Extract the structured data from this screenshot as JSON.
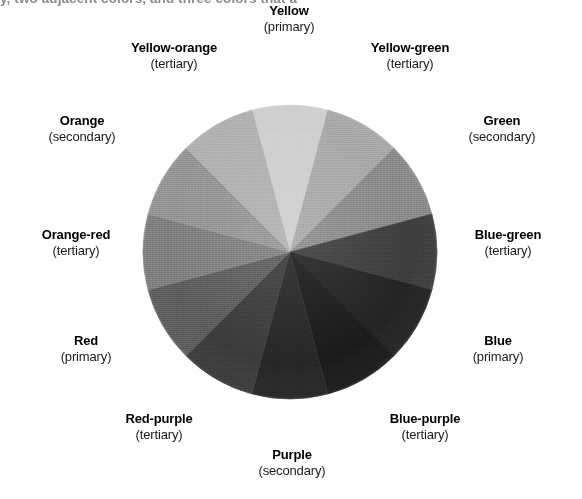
{
  "figure": {
    "caption_clipped": "y, two adjacent colors, and three colors that a"
  },
  "wheel": {
    "center_x": 148,
    "center_y": 148,
    "radius": 147,
    "segment_count": 12,
    "segment_degrees": 30,
    "start_angle_deg": -15,
    "segments": [
      {
        "id": "yellow",
        "name": "Yellow",
        "kind": "(primary)",
        "color": "#cfcfcf",
        "angle_center_deg": 0
      },
      {
        "id": "yellow-green",
        "name": "Yellow-green",
        "kind": "(tertiary)",
        "color": "#a9a9a9",
        "angle_center_deg": 30
      },
      {
        "id": "green",
        "name": "Green",
        "kind": "(secondary)",
        "color": "#8b8b8b",
        "angle_center_deg": 60
      },
      {
        "id": "blue-green",
        "name": "Blue-green",
        "kind": "(tertiary)",
        "color": "#3d3d3d",
        "angle_center_deg": 90
      },
      {
        "id": "blue",
        "name": "Blue",
        "kind": "(primary)",
        "color": "#232323",
        "angle_center_deg": 120
      },
      {
        "id": "blue-purple",
        "name": "Blue-purple",
        "kind": "(tertiary)",
        "color": "#1a1a1a",
        "angle_center_deg": 150
      },
      {
        "id": "purple",
        "name": "Purple",
        "kind": "(secondary)",
        "color": "#262626",
        "angle_center_deg": 180
      },
      {
        "id": "red-purple",
        "name": "Red-purple",
        "kind": "(tertiary)",
        "color": "#3b3b3b",
        "angle_center_deg": 210
      },
      {
        "id": "red",
        "name": "Red",
        "kind": "(primary)",
        "color": "#5d5d5d",
        "angle_center_deg": 240
      },
      {
        "id": "orange-red",
        "name": "Orange-red",
        "kind": "(tertiary)",
        "color": "#7f7f7f",
        "angle_center_deg": 270
      },
      {
        "id": "orange",
        "name": "Orange",
        "kind": "(secondary)",
        "color": "#959595",
        "angle_center_deg": 300
      },
      {
        "id": "yellow-orange",
        "name": "Yellow-orange",
        "kind": "(tertiary)",
        "color": "#b1b1b1",
        "angle_center_deg": 330
      }
    ]
  },
  "chart_data": {
    "type": "pie",
    "categories": [
      "Yellow",
      "Yellow-green",
      "Green",
      "Blue-green",
      "Blue",
      "Blue-purple",
      "Purple",
      "Red-purple",
      "Red",
      "Orange-red",
      "Orange",
      "Yellow-orange"
    ],
    "values": [
      30,
      30,
      30,
      30,
      30,
      30,
      30,
      30,
      30,
      30,
      30,
      30
    ],
    "value_unit": "degrees",
    "colors": [
      "#cfcfcf",
      "#a9a9a9",
      "#8b8b8b",
      "#3d3d3d",
      "#232323",
      "#1a1a1a",
      "#262626",
      "#3b3b3b",
      "#5d5d5d",
      "#7f7f7f",
      "#959595",
      "#b1b1b1"
    ],
    "annotations": [
      "(primary)",
      "(tertiary)",
      "(secondary)",
      "(tertiary)",
      "(primary)",
      "(tertiary)",
      "(secondary)",
      "(tertiary)",
      "(primary)",
      "(tertiary)",
      "(secondary)",
      "(tertiary)"
    ],
    "legend": "none",
    "grid": false
  }
}
